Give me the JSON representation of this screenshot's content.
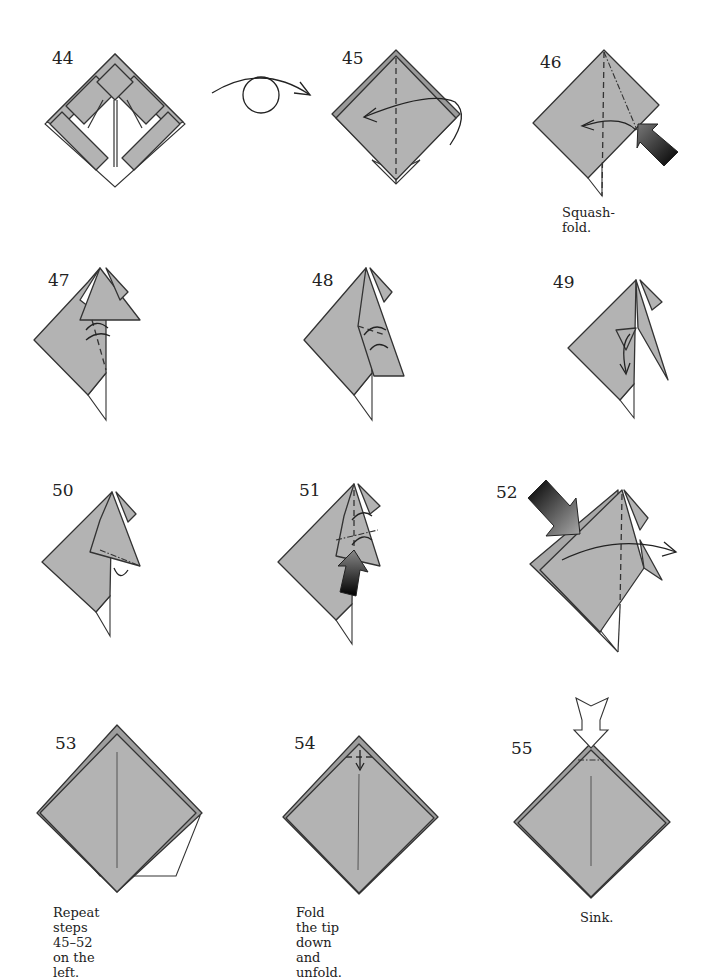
{
  "page": {
    "type": "origami-diagram-sequence",
    "background": "#ffffff",
    "paper_color": "#b3b3b3",
    "line_color": "#333333"
  },
  "steps": [
    {
      "number": "44",
      "caption": "",
      "symbols": [
        "turn-over-arrow"
      ]
    },
    {
      "number": "45",
      "caption": "",
      "symbols": [
        "valley-fold-line",
        "fold-arrow"
      ]
    },
    {
      "number": "46",
      "caption": "Squash-fold.",
      "symbols": [
        "valley-fold-line",
        "mountain-fold-line",
        "fold-arrow",
        "push-arrow"
      ]
    },
    {
      "number": "47",
      "caption": "",
      "symbols": [
        "valley-fold-line",
        "fold-arrow"
      ]
    },
    {
      "number": "48",
      "caption": "",
      "symbols": [
        "valley-fold-line",
        "fold-arrow"
      ]
    },
    {
      "number": "49",
      "caption": "",
      "symbols": [
        "fold-arrow"
      ]
    },
    {
      "number": "50",
      "caption": "",
      "symbols": [
        "mountain-fold-line",
        "unfold-arrow"
      ]
    },
    {
      "number": "51",
      "caption": "",
      "symbols": [
        "valley-fold-line",
        "mountain-fold-line",
        "push-arrow"
      ]
    },
    {
      "number": "52",
      "caption": "",
      "symbols": [
        "valley-fold-line",
        "fold-arrow",
        "push-arrow"
      ]
    },
    {
      "number": "53",
      "caption": "Repeat steps 45–52\non the left.",
      "symbols": []
    },
    {
      "number": "54",
      "caption": "Fold the tip down\nand unfold.",
      "symbols": [
        "valley-fold-line",
        "fold-unfold-arrow"
      ]
    },
    {
      "number": "55",
      "caption": "Sink.",
      "symbols": [
        "mountain-fold-line",
        "sink-arrow"
      ]
    }
  ]
}
